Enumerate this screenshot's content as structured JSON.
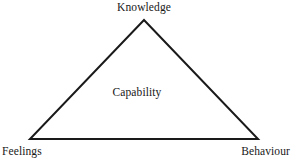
{
  "figure": {
    "type": "triangle-diagram",
    "title_text": "",
    "background_color": "#ffffff",
    "stroke_color": "#1a1a1a",
    "text_color": "#181818",
    "stroke_width": 2,
    "geometry": {
      "apex": [
        144,
        20
      ],
      "bottom_left": [
        30,
        139
      ],
      "bottom_right": [
        258,
        139
      ]
    },
    "labels": {
      "apex": "Knowledge",
      "center": "Capability",
      "bottom_left": "Feelings",
      "bottom_right": "Behaviour"
    }
  },
  "chart_data": {
    "type": "diagram",
    "title": "",
    "nodes": [
      {
        "id": "knowledge",
        "label": "Knowledge",
        "position": "apex",
        "x": 144,
        "y": 20
      },
      {
        "id": "feelings",
        "label": "Feelings",
        "position": "bottom-left",
        "x": 30,
        "y": 139
      },
      {
        "id": "behaviour",
        "label": "Behaviour",
        "position": "bottom-right",
        "x": 258,
        "y": 139
      },
      {
        "id": "capability",
        "label": "Capability",
        "position": "center",
        "x": 137,
        "y": 95
      }
    ],
    "edges": [
      {
        "from": "feelings",
        "to": "knowledge"
      },
      {
        "from": "knowledge",
        "to": "behaviour"
      },
      {
        "from": "feelings",
        "to": "behaviour"
      }
    ]
  }
}
